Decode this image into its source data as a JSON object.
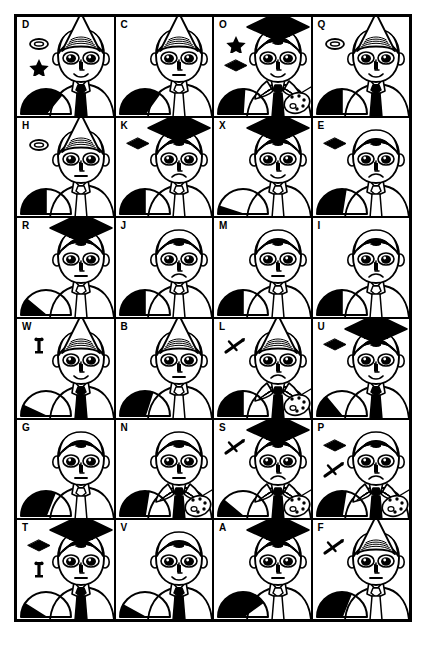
{
  "sheet": {
    "title": "Character attribute grid",
    "columns": 4,
    "rows": 6,
    "ink_color": "#000000",
    "paper_color": "#ffffff"
  },
  "legend": {
    "hat_types": [
      "cone",
      "mortarboard",
      "none"
    ],
    "icon_types": [
      "ring",
      "star",
      "mortarboard",
      "sword",
      "key"
    ],
    "mouth_types": [
      "smile",
      "neutral",
      "frown"
    ],
    "tie_fill": [
      "black",
      "white"
    ],
    "collar_types": [
      "shirt",
      "ruff"
    ],
    "prop_types": [
      "palette",
      "none"
    ]
  },
  "cells": [
    {
      "label": "D",
      "hat": "cone",
      "icons": [
        "ring",
        "star"
      ],
      "mouth": "smile",
      "tie": "black",
      "collar": "shirt",
      "prop": "none",
      "dome_black": 0.72,
      "dome_style": "pie"
    },
    {
      "label": "C",
      "hat": "cone",
      "icons": [],
      "mouth": "neutral",
      "tie": "white",
      "collar": "shirt",
      "prop": "none",
      "dome_black": 0.7,
      "dome_style": "pie"
    },
    {
      "label": "O",
      "hat": "mortarboard",
      "icons": [
        "star",
        "mortarboard"
      ],
      "mouth": "smile",
      "tie": "black",
      "collar": "ruff",
      "prop": "palette",
      "dome_black": 0.52,
      "dome_style": "pie"
    },
    {
      "label": "Q",
      "hat": "cone",
      "icons": [
        "ring"
      ],
      "mouth": "smile",
      "tie": "black",
      "collar": "shirt",
      "prop": "none",
      "dome_black": 0.5,
      "dome_style": "pie"
    },
    {
      "label": "H",
      "hat": "cone",
      "icons": [
        "ring"
      ],
      "mouth": "neutral",
      "tie": "white",
      "collar": "shirt",
      "prop": "none",
      "dome_black": 0.5,
      "dome_style": "pie"
    },
    {
      "label": "K",
      "hat": "mortarboard",
      "icons": [
        "mortarboard"
      ],
      "mouth": "frown",
      "tie": "white",
      "collar": "shirt",
      "prop": "none",
      "dome_black": 0.5,
      "dome_style": "pie"
    },
    {
      "label": "X",
      "hat": "mortarboard",
      "icons": [],
      "mouth": "smile",
      "tie": "white",
      "collar": "shirt",
      "prop": "none",
      "dome_black": 0.1,
      "dome_style": "pie"
    },
    {
      "label": "E",
      "hat": "none",
      "icons": [
        "mortarboard"
      ],
      "mouth": "frown",
      "tie": "white",
      "collar": "shirt",
      "prop": "none",
      "dome_black": 0.55,
      "dome_style": "pie"
    },
    {
      "label": "R",
      "hat": "mortarboard",
      "icons": [],
      "mouth": "neutral",
      "tie": "white",
      "collar": "shirt",
      "prop": "none",
      "dome_black": 0.22,
      "dome_style": "pie"
    },
    {
      "label": "J",
      "hat": "none",
      "icons": [],
      "mouth": "frown",
      "tie": "white",
      "collar": "shirt",
      "prop": "none",
      "dome_black": 0.5,
      "dome_style": "pie"
    },
    {
      "label": "M",
      "hat": "none",
      "icons": [],
      "mouth": "neutral",
      "tie": "white",
      "collar": "shirt",
      "prop": "none",
      "dome_black": 0.5,
      "dome_style": "pie"
    },
    {
      "label": "I",
      "hat": "none",
      "icons": [],
      "mouth": "frown",
      "tie": "white",
      "collar": "shirt",
      "prop": "none",
      "dome_black": 0.5,
      "dome_style": "pie"
    },
    {
      "label": "W",
      "hat": "cone",
      "icons": [
        "key"
      ],
      "mouth": "smile",
      "tie": "black",
      "collar": "shirt",
      "prop": "none",
      "dome_black": 0.14,
      "dome_style": "pie"
    },
    {
      "label": "B",
      "hat": "cone",
      "icons": [],
      "mouth": "neutral",
      "tie": "white",
      "collar": "shirt",
      "prop": "none",
      "dome_black": 0.6,
      "dome_style": "pie"
    },
    {
      "label": "L",
      "hat": "cone",
      "icons": [
        "sword"
      ],
      "mouth": "frown",
      "tie": "black",
      "collar": "ruff",
      "prop": "palette",
      "dome_black": 0.5,
      "dome_style": "pie"
    },
    {
      "label": "U",
      "hat": "mortarboard",
      "icons": [
        "mortarboard"
      ],
      "mouth": "smile",
      "tie": "black",
      "collar": "shirt",
      "prop": "none",
      "dome_black": 0.28,
      "dome_style": "pie"
    },
    {
      "label": "G",
      "hat": "none",
      "icons": [],
      "mouth": "neutral",
      "tie": "white",
      "collar": "shirt",
      "prop": "none",
      "dome_black": 0.62,
      "dome_style": "pie"
    },
    {
      "label": "N",
      "hat": "none",
      "icons": [],
      "mouth": "neutral",
      "tie": "black",
      "collar": "ruff",
      "prop": "palette",
      "dome_black": 0.55,
      "dome_style": "pie"
    },
    {
      "label": "S",
      "hat": "mortarboard",
      "icons": [
        "sword"
      ],
      "mouth": "frown",
      "tie": "black",
      "collar": "ruff",
      "prop": "palette",
      "dome_black": 0.22,
      "dome_style": "pie"
    },
    {
      "label": "P",
      "hat": "none",
      "icons": [
        "mortarboard",
        "sword"
      ],
      "mouth": "frown",
      "tie": "black",
      "collar": "ruff",
      "prop": "palette",
      "dome_black": 0.55,
      "dome_style": "pie"
    },
    {
      "label": "T",
      "hat": "mortarboard",
      "icons": [
        "mortarboard",
        "key"
      ],
      "mouth": "neutral",
      "tie": "black",
      "collar": "shirt",
      "prop": "none",
      "dome_black": 0.18,
      "dome_style": "pie"
    },
    {
      "label": "V",
      "hat": "none",
      "icons": [],
      "mouth": "smile",
      "tie": "black",
      "collar": "shirt",
      "prop": "none",
      "dome_black": 0.16,
      "dome_style": "pie"
    },
    {
      "label": "A",
      "hat": "mortarboard",
      "icons": [],
      "mouth": "neutral",
      "tie": "white",
      "collar": "shirt",
      "prop": "none",
      "dome_black": 0.8,
      "dome_style": "pie"
    },
    {
      "label": "F",
      "hat": "cone",
      "icons": [
        "sword"
      ],
      "mouth": "neutral",
      "tie": "white",
      "collar": "shirt",
      "prop": "none",
      "dome_black": 0.62,
      "dome_style": "pie"
    }
  ]
}
